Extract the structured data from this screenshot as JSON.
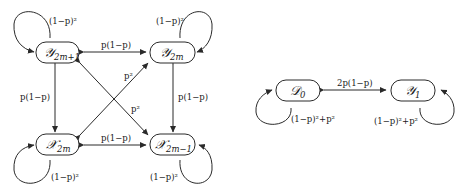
{
  "left_diagram": {
    "nodes": {
      "y2m1": {
        "symbol": "𝒴",
        "sub": "2m+1"
      },
      "y2m": {
        "symbol": "𝒴",
        "sub": "2m"
      },
      "x2m": {
        "symbol": "𝒳",
        "sub": "2m"
      },
      "x2m1": {
        "symbol": "𝒳",
        "sub": "2m−1"
      }
    },
    "edges": {
      "top": "p(1−p)",
      "bottom": "p(1−p)",
      "left": "p(1−p)",
      "right": "p(1−p)",
      "diag_up": "p²",
      "diag_down": "p²"
    },
    "loops": {
      "y2m1": "(1−p)²",
      "y2m": "(1−p)²",
      "x2m": "(1−p)²",
      "x2m1": "(1−p)²"
    }
  },
  "right_diagram": {
    "nodes": {
      "d0": {
        "symbol": "𝒟",
        "sub": "0"
      },
      "y1": {
        "symbol": "𝒴",
        "sub": "1"
      }
    },
    "edges": {
      "middle": "2p(1−p)"
    },
    "loops": {
      "d0": "(1−p)²+p²",
      "y1": "(1−p)²+p²"
    }
  }
}
